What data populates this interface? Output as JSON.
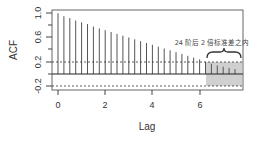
{
  "chart_data": {
    "type": "bar",
    "title": "",
    "xlabel": "Lag",
    "ylabel": "ACF",
    "xlim": [
      -0.3,
      7.8
    ],
    "ylim": [
      -0.25,
      1.05
    ],
    "x_ticks": [
      "0",
      "2",
      "4",
      "6"
    ],
    "y_ticks": [
      "-0.2",
      "0.2",
      "0.6",
      "1.0"
    ],
    "confidence_band": [
      -0.2,
      0.2
    ],
    "lag_step": 0.25,
    "x": [
      0,
      0.25,
      0.5,
      0.75,
      1,
      1.25,
      1.5,
      1.75,
      2,
      2.25,
      2.5,
      2.75,
      3,
      3.25,
      3.5,
      3.75,
      4,
      4.25,
      4.5,
      4.75,
      5,
      5.25,
      5.5,
      5.75,
      6,
      6.25,
      6.5,
      6.75,
      7,
      7.25,
      7.5
    ],
    "values": [
      1.0,
      0.95,
      0.92,
      0.88,
      0.85,
      0.82,
      0.78,
      0.75,
      0.72,
      0.69,
      0.66,
      0.63,
      0.6,
      0.57,
      0.54,
      0.51,
      0.48,
      0.45,
      0.42,
      0.39,
      0.36,
      0.33,
      0.3,
      0.27,
      0.24,
      0.2,
      0.17,
      0.14,
      0.12,
      0.1,
      0.08
    ],
    "shaded_region": {
      "x_from": 6.3,
      "x_to": 7.8,
      "y_from": -0.2,
      "y_to": 0.2
    },
    "annotation": "24 阶后 2 倍标准差之内",
    "grid": false,
    "legend": "none"
  },
  "labels": {
    "xlabel": "Lag",
    "ylabel": "ACF",
    "annotation": "24 阶后 2 倍标准差之内",
    "xticks": [
      "0",
      "2",
      "4",
      "6"
    ],
    "yticks": [
      "-0.2",
      "0.2",
      "0.6",
      "1.0"
    ]
  },
  "colors": {
    "bar": "#555555",
    "band_line": "#333333",
    "shade": "#c8c8c8",
    "axis": "#444444"
  }
}
